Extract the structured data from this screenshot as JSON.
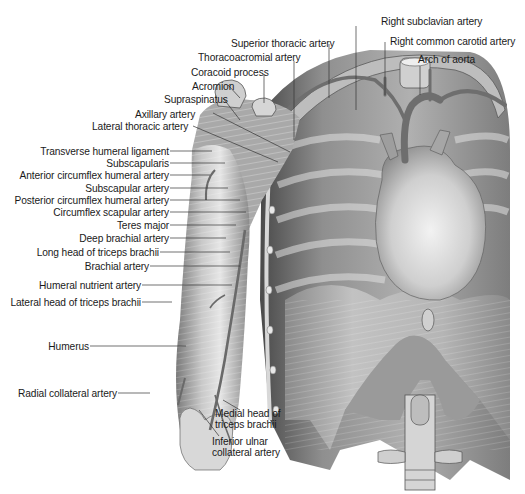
{
  "figure": {
    "colors": {
      "background": "#ffffff",
      "tissue_light": "#d9d9d9",
      "tissue_mid": "#a8a8a8",
      "tissue_dark": "#5e5e5e",
      "artery": "#6a6a6a",
      "leader_line": "#333333",
      "label_text": "#1a1a1a"
    }
  },
  "labels": {
    "top": [
      {
        "id": "right_subclavian_artery",
        "text": "Right subclavian artery"
      },
      {
        "id": "superior_thoracic_artery",
        "text": "Superior thoracic artery"
      },
      {
        "id": "right_common_carotid_artery",
        "text": "Right common carotid artery"
      },
      {
        "id": "thoracoacromial_artery",
        "text": "Thoracoacromial artery"
      },
      {
        "id": "arch_of_aorta",
        "text": "Arch of aorta"
      },
      {
        "id": "coracoid_process",
        "text": "Coracoid process"
      },
      {
        "id": "acromion",
        "text": "Acromion"
      },
      {
        "id": "supraspinatus",
        "text": "Supraspinatus"
      },
      {
        "id": "axillary_artery",
        "text": "Axillary artery"
      },
      {
        "id": "lateral_thoracic_artery",
        "text": "Lateral thoracic artery"
      }
    ],
    "left": [
      {
        "id": "transverse_humeral_ligament",
        "text": "Transverse humeral ligament"
      },
      {
        "id": "subscapularis",
        "text": "Subscapularis"
      },
      {
        "id": "anterior_circumflex_humeral_artery",
        "text": "Anterior circumflex humeral artery"
      },
      {
        "id": "subscapular_artery",
        "text": "Subscapular artery"
      },
      {
        "id": "posterior_circumflex_humeral_artery",
        "text": "Posterior circumflex humeral artery"
      },
      {
        "id": "circumflex_scapular_artery",
        "text": "Circumflex scapular artery"
      },
      {
        "id": "teres_major",
        "text": "Teres major"
      },
      {
        "id": "deep_brachial_artery",
        "text": "Deep brachial artery"
      },
      {
        "id": "long_head_of_triceps_brachii",
        "text": "Long head of triceps brachii"
      },
      {
        "id": "brachial_artery",
        "text": "Brachial artery"
      },
      {
        "id": "humeral_nutrient_artery",
        "text": "Humeral nutrient artery"
      },
      {
        "id": "lateral_head_of_triceps_brachii",
        "text": "Lateral head of triceps brachii"
      },
      {
        "id": "humerus",
        "text": "Humerus"
      },
      {
        "id": "radial_collateral_artery",
        "text": "Radial collateral artery"
      }
    ],
    "bottom": [
      {
        "id": "medial_head_of_triceps_brachii",
        "line1": "Medial head of",
        "line2": "triceps brachii"
      },
      {
        "id": "inferior_ulnar_collateral_artery",
        "line1": "Inferior ulnar",
        "line2": "collateral artery"
      }
    ]
  }
}
